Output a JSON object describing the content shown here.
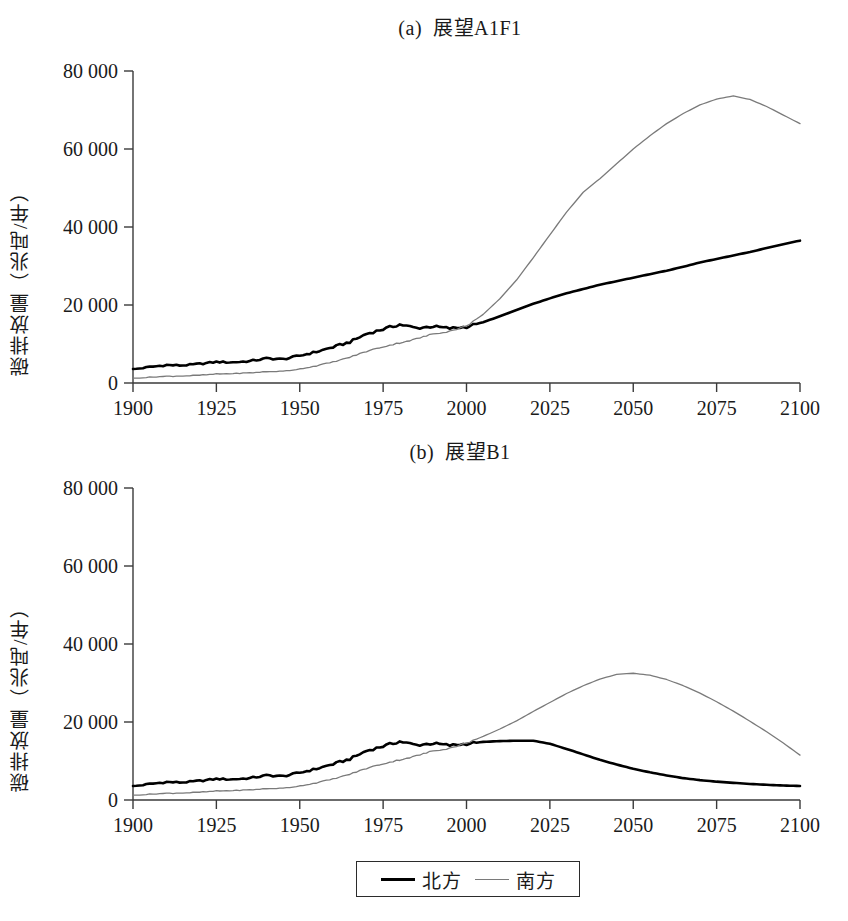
{
  "figure": {
    "legend": {
      "box_name": "legend-box",
      "entries": [
        {
          "label": "北方",
          "style": "solid-thick-black",
          "color": "#000000"
        },
        {
          "label": "南方",
          "style": "thin-gray",
          "color": "#7a7a7a"
        }
      ]
    }
  },
  "chart_data": [
    {
      "type": "line",
      "panel": "a",
      "title": "(a)  展望A1F1",
      "xlabel": "",
      "ylabel": "碳排放量（兆吨/年）",
      "xlim": [
        1900,
        2100
      ],
      "ylim": [
        0,
        80000
      ],
      "xticks": [
        1900,
        1925,
        1950,
        1975,
        2000,
        2025,
        2050,
        2075,
        2100
      ],
      "xticklabels": [
        "1900",
        "1925",
        "1950",
        "1975",
        "2000",
        "2025",
        "2050",
        "2075",
        "2100"
      ],
      "yticks": [
        0,
        20000,
        40000,
        60000,
        80000
      ],
      "yticklabels": [
        "0",
        "20 000",
        "40 000",
        "60 000",
        "80 000"
      ],
      "grid": false,
      "legend_position": "below-figure",
      "x": [
        1900,
        1905,
        1910,
        1915,
        1920,
        1925,
        1930,
        1935,
        1940,
        1945,
        1950,
        1955,
        1960,
        1965,
        1970,
        1975,
        1980,
        1985,
        1990,
        1995,
        2000,
        2005,
        2010,
        2015,
        2020,
        2025,
        2030,
        2035,
        2040,
        2045,
        2050,
        2055,
        2060,
        2065,
        2070,
        2075,
        2080,
        2085,
        2090,
        2095,
        2100
      ],
      "series": [
        {
          "name": "北方",
          "color": "#000000",
          "width": 2.6,
          "values": [
            3500,
            4100,
            4600,
            4500,
            4900,
            5400,
            5300,
            5600,
            6300,
            6100,
            7000,
            8000,
            9200,
            10500,
            12600,
            13800,
            15000,
            14100,
            14500,
            14000,
            14400,
            15600,
            17100,
            18700,
            20300,
            21700,
            23000,
            24100,
            25200,
            26100,
            27000,
            27900,
            28800,
            29800,
            30900,
            31800,
            32700,
            33600,
            34600,
            35600,
            36500
          ]
        },
        {
          "name": "南方",
          "color": "#7a7a7a",
          "width": 1.3,
          "values": [
            1200,
            1500,
            1700,
            1800,
            2000,
            2300,
            2400,
            2600,
            2900,
            3000,
            3600,
            4400,
            5400,
            6600,
            8100,
            9300,
            10300,
            11300,
            12600,
            13300,
            14600,
            17600,
            21600,
            26400,
            32100,
            38000,
            43800,
            48900,
            52400,
            56200,
            60000,
            63400,
            66500,
            69100,
            71300,
            72800,
            73600,
            72700,
            70900,
            68700,
            66500
          ]
        }
      ]
    },
    {
      "type": "line",
      "panel": "b",
      "title": "(b)  展望B1",
      "xlabel": "",
      "ylabel": "碳排放量（兆吨/年）",
      "xlim": [
        1900,
        2100
      ],
      "ylim": [
        0,
        80000
      ],
      "xticks": [
        1900,
        1925,
        1950,
        1975,
        2000,
        2025,
        2050,
        2075,
        2100
      ],
      "xticklabels": [
        "1900",
        "1925",
        "1950",
        "1975",
        "2000",
        "2025",
        "2050",
        "2075",
        "2100"
      ],
      "yticks": [
        0,
        20000,
        40000,
        60000,
        80000
      ],
      "yticklabels": [
        "0",
        "20 000",
        "40 000",
        "60 000",
        "80 000"
      ],
      "grid": false,
      "legend_position": "below-figure",
      "x": [
        1900,
        1905,
        1910,
        1915,
        1920,
        1925,
        1930,
        1935,
        1940,
        1945,
        1950,
        1955,
        1960,
        1965,
        1970,
        1975,
        1980,
        1985,
        1990,
        1995,
        2000,
        2005,
        2010,
        2015,
        2020,
        2025,
        2030,
        2035,
        2040,
        2045,
        2050,
        2055,
        2060,
        2065,
        2070,
        2075,
        2080,
        2085,
        2090,
        2095,
        2100
      ],
      "series": [
        {
          "name": "北方",
          "color": "#000000",
          "width": 2.6,
          "values": [
            3500,
            4100,
            4600,
            4500,
            4900,
            5400,
            5300,
            5600,
            6300,
            6100,
            7000,
            8000,
            9200,
            10500,
            12600,
            13800,
            15000,
            14100,
            14500,
            14000,
            14400,
            14900,
            15100,
            15200,
            15200,
            14400,
            13100,
            11700,
            10300,
            9100,
            8000,
            7100,
            6300,
            5600,
            5100,
            4700,
            4400,
            4100,
            3900,
            3700,
            3600
          ]
        },
        {
          "name": "南方",
          "color": "#7a7a7a",
          "width": 1.3,
          "values": [
            1200,
            1500,
            1700,
            1800,
            2000,
            2300,
            2400,
            2600,
            2900,
            3000,
            3600,
            4400,
            5400,
            6600,
            8100,
            9300,
            10300,
            11300,
            12600,
            13300,
            14600,
            16300,
            18200,
            20300,
            22700,
            25000,
            27300,
            29300,
            31000,
            32200,
            32500,
            32000,
            30900,
            29300,
            27400,
            25200,
            22800,
            20200,
            17500,
            14600,
            11500
          ]
        }
      ]
    }
  ]
}
